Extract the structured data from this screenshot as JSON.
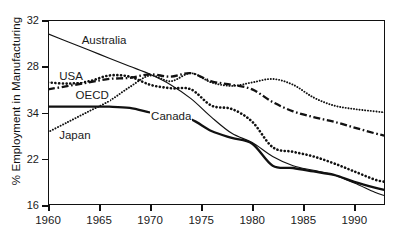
{
  "chart_data": {
    "type": "line",
    "title": "",
    "xlabel": "",
    "ylabel": "% Employment in Manufacturing",
    "xlim": [
      1960,
      1993
    ],
    "ylim": [
      16,
      32
    ],
    "grid": false,
    "legend_position": "inline-annotations",
    "x_ticks": [
      "1960",
      "1965",
      "1970",
      "1975",
      "1980",
      "1985",
      "1990"
    ],
    "x_tick_values": [
      1960,
      1965,
      1970,
      1975,
      1980,
      1985,
      1990
    ],
    "y_ticks": [
      "32",
      "28",
      "34",
      "22",
      "16"
    ],
    "y_tick_values": [
      32,
      28,
      24,
      22,
      16
    ],
    "y_tick_note": "Third label is printed as 34 in the scan; ticks are evenly spaced.",
    "annotations": [
      {
        "text": "Australia",
        "x": 1963.2,
        "y": 30.2
      },
      {
        "text": "USA",
        "x": 1961.0,
        "y": 27.1
      },
      {
        "text": "OECD",
        "x": 1962.6,
        "y": 25.4
      },
      {
        "text": "Canada",
        "x": 1970.0,
        "y": 23.6
      },
      {
        "text": "Japan",
        "x": 1961.0,
        "y": 22.0
      }
    ],
    "series": [
      {
        "name": "Australia",
        "style": "solid-thin",
        "color": "#111111",
        "x": [
          1960,
          1962,
          1964,
          1966,
          1968,
          1970,
          1972,
          1974,
          1976,
          1978,
          1980,
          1982,
          1984,
          1986,
          1988,
          1990,
          1992,
          1993
        ],
        "values": [
          30.8,
          30.1,
          29.4,
          28.7,
          28.0,
          27.3,
          26.4,
          25.2,
          23.6,
          22.2,
          21.4,
          20.2,
          19.4,
          19.0,
          18.6,
          17.9,
          17.1,
          16.8
        ]
      },
      {
        "name": "USA",
        "style": "dotted-bold",
        "color": "#111111",
        "x": [
          1960,
          1962,
          1964,
          1966,
          1968,
          1970,
          1972,
          1974,
          1976,
          1978,
          1980,
          1982,
          1984,
          1986,
          1988,
          1990,
          1992,
          1993
        ],
        "values": [
          26.6,
          26.5,
          26.7,
          27.2,
          27.1,
          26.4,
          26.1,
          26.0,
          24.6,
          24.3,
          23.2,
          21.0,
          20.6,
          20.2,
          19.6,
          18.9,
          18.2,
          18.0
        ]
      },
      {
        "name": "OECD",
        "style": "dash-dot",
        "color": "#111111",
        "x": [
          1960,
          1962,
          1964,
          1966,
          1968,
          1970,
          1972,
          1974,
          1976,
          1978,
          1980,
          1982,
          1984,
          1986,
          1988,
          1990,
          1992,
          1993
        ],
        "values": [
          26.0,
          26.3,
          26.6,
          26.9,
          27.0,
          27.3,
          27.1,
          27.4,
          26.7,
          26.4,
          26.0,
          24.9,
          24.1,
          23.6,
          23.2,
          22.7,
          22.2,
          22.0
        ]
      },
      {
        "name": "Canada",
        "style": "solid-thick",
        "color": "#111111",
        "x": [
          1960,
          1962,
          1964,
          1966,
          1968,
          1970,
          1972,
          1974,
          1976,
          1978,
          1980,
          1982,
          1984,
          1986,
          1988,
          1990,
          1992,
          1993
        ],
        "values": [
          24.5,
          24.5,
          24.5,
          24.5,
          24.4,
          24.0,
          23.6,
          23.4,
          22.4,
          21.8,
          21.3,
          19.4,
          19.2,
          18.9,
          18.6,
          18.0,
          17.5,
          17.3
        ]
      },
      {
        "name": "Japan",
        "style": "dotted-fine",
        "color": "#111111",
        "x": [
          1960,
          1962,
          1964,
          1966,
          1968,
          1970,
          1972,
          1974,
          1976,
          1978,
          1980,
          1982,
          1984,
          1986,
          1988,
          1990,
          1992,
          1993
        ],
        "values": [
          22.3,
          23.2,
          24.1,
          25.0,
          26.2,
          27.2,
          26.7,
          27.4,
          26.6,
          26.3,
          26.6,
          26.9,
          26.4,
          25.3,
          24.6,
          24.3,
          24.1,
          24.0
        ]
      }
    ]
  }
}
